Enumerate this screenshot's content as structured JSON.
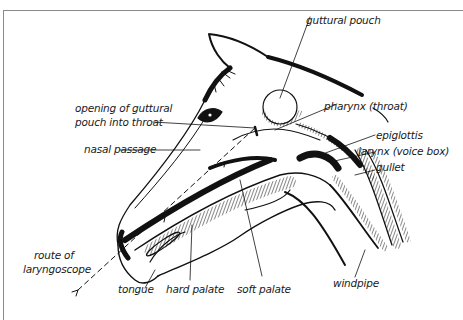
{
  "diagram": {
    "labels": {
      "guttural_pouch": "guttural pouch",
      "opening_line1": "opening of guttural",
      "opening_line2": "pouch into throat",
      "pharynx": "pharynx (throat)",
      "epiglottis": "epiglottis",
      "nasal_passage": "nasal passage",
      "larynx": "larynx (voice box)",
      "gullet": "gullet",
      "route_line1": "route of",
      "route_line2": "laryngoscope",
      "tongue": "tongue",
      "hard_palate": "hard palate",
      "soft_palate": "soft palate",
      "windpipe": "windpipe"
    },
    "colors": {
      "ink": "#111111",
      "label": "#1a1a1a",
      "frame": "#8a8a8a",
      "background": "#ffffff"
    }
  }
}
